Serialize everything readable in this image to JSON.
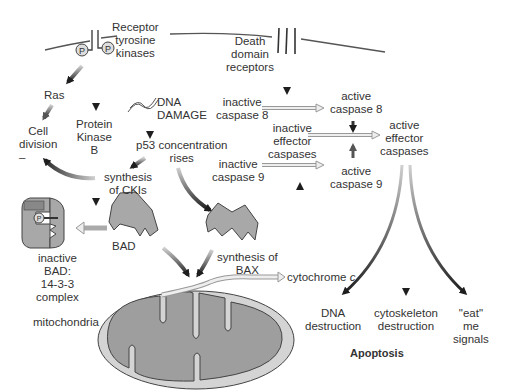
{
  "membrane": {
    "rtk_label": [
      "Receptor",
      "tyrosine",
      "kinases"
    ],
    "death_label": [
      "Death",
      "domain",
      "receptors"
    ],
    "phospho_symbol": "P"
  },
  "survival_pathway": {
    "ras": "Ras",
    "cell_division": [
      "Cell",
      "division"
    ],
    "minus_sign": "–",
    "pkb": [
      "Protein",
      "Kinase",
      "B"
    ],
    "bad": "BAD",
    "inactive_complex": [
      "inactive",
      "BAD:",
      "14-3-3",
      "complex"
    ],
    "complex_tag": "14-3-3 protein"
  },
  "p53_pathway": {
    "dna_damage": [
      "DNA",
      "DAMAGE"
    ],
    "p53": [
      "p53 concentration",
      "rises"
    ],
    "ckis": [
      "synthesis",
      "of CKIs"
    ],
    "bax": [
      "synthesis of",
      "BAX"
    ]
  },
  "caspase_cascade": {
    "inactive_c8": [
      "inactive",
      "caspase 8"
    ],
    "active_c8": [
      "active",
      "caspase 8"
    ],
    "inactive_eff": [
      "inactive",
      "effector",
      "caspases"
    ],
    "active_eff": [
      "active",
      "effector",
      "caspases"
    ],
    "inactive_c9": [
      "inactive",
      "caspase 9"
    ],
    "active_c9": [
      "active",
      "caspase 9"
    ]
  },
  "mitochondria": {
    "label": "mitochondria",
    "cyto_prefix": "cytochrome ",
    "cyto_suffix": "c"
  },
  "outcomes": {
    "dna": [
      "DNA",
      "destruction"
    ],
    "cyto": [
      "cytoskeleton",
      "destruction"
    ],
    "eat": [
      "\"eat\"",
      "me",
      "signals"
    ],
    "title": "Apoptosis"
  },
  "colors": {
    "membrane": "#555555",
    "protein_fill": "#a8a8a8",
    "mito_outer": "#d4d4d4",
    "mito_inner": "#9e9e9e",
    "arrow_dark": "#2a2a2a",
    "arrow_light": "#bdbdbd"
  }
}
